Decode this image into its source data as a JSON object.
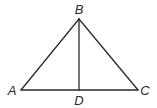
{
  "figure": {
    "type": "triangle-with-altitude",
    "stroke_color": "#2a2a2a",
    "label_color": "#2a2a2a",
    "points": {
      "A": {
        "x": 21,
        "y": 90,
        "label": "A",
        "label_x": 12,
        "label_y": 95
      },
      "B": {
        "x": 79,
        "y": 19,
        "label": "B",
        "label_x": 79,
        "label_y": 14
      },
      "C": {
        "x": 138,
        "y": 90,
        "label": "C",
        "label_x": 145,
        "label_y": 95
      },
      "D": {
        "x": 79,
        "y": 90,
        "label": "D",
        "label_x": 79,
        "label_y": 105
      }
    },
    "segments": [
      "AB",
      "BC",
      "AC",
      "BD"
    ]
  }
}
